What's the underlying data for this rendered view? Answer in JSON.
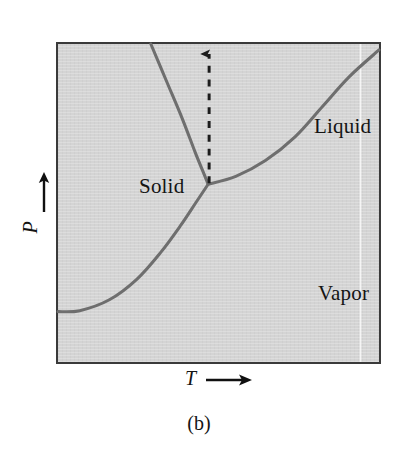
{
  "figure": {
    "caption": "(b)",
    "background_color": "#ffffff",
    "plot_fill_color": "#d4d4d4",
    "frame_color": "#3a3a3a",
    "curve_color": "#6e6e6e",
    "text_color": "#141414"
  },
  "axes": {
    "x": {
      "label": "T",
      "arrow_icon": "right-arrow-icon"
    },
    "y": {
      "label": "P",
      "arrow_icon": "up-arrow-icon"
    }
  },
  "regions": [
    {
      "key": "solid",
      "label": "Solid"
    },
    {
      "key": "liquid",
      "label": "Liquid"
    },
    {
      "key": "vapor",
      "label": "Vapor"
    }
  ],
  "annotations": {
    "process_path": {
      "name": "isothermal-heating-arrow",
      "style": "dashed",
      "arrow_icon": "up-arrow-icon"
    }
  },
  "chart_data": {
    "type": "line",
    "title": "",
    "subtitle": "",
    "xlabel": "T",
    "ylabel": "P",
    "xlim": [
      0,
      325
    ],
    "ylim": [
      0,
      322
    ],
    "grid": false,
    "legend": null,
    "axis_tick_labels": {
      "x": [],
      "y": []
    },
    "points_of_interest": [
      {
        "name": "triple-point",
        "x": 152,
        "y": 142
      }
    ],
    "series": [
      {
        "name": "fusion-curve",
        "description": "solid-liquid coexistence boundary, steep positive slope",
        "style": "solid",
        "points": [
          [
            94,
            0
          ],
          [
            110,
            38
          ],
          [
            126,
            76
          ],
          [
            139,
            110
          ],
          [
            148,
            132
          ],
          [
            152,
            142
          ]
        ]
      },
      {
        "name": "vaporization-curve",
        "description": "liquid-vapor coexistence boundary, rising concave-up to the right edge",
        "style": "solid",
        "points": [
          [
            152,
            142
          ],
          [
            180,
            134
          ],
          [
            210,
            118
          ],
          [
            240,
            94
          ],
          [
            268,
            63
          ],
          [
            295,
            33
          ],
          [
            325,
            6
          ]
        ]
      },
      {
        "name": "sublimation-curve",
        "description": "solid-vapor coexistence boundary, descending to the left edge",
        "style": "solid",
        "points": [
          [
            152,
            142
          ],
          [
            140,
            160
          ],
          [
            124,
            184
          ],
          [
            104,
            211
          ],
          [
            80,
            238
          ],
          [
            52,
            259
          ],
          [
            22,
            270
          ],
          [
            0,
            271
          ]
        ]
      },
      {
        "name": "heating-path",
        "description": "dashed vertical arrow rising from the triple point through the solid-liquid boundary into the liquid region",
        "style": "dashed",
        "points": [
          [
            153,
            142
          ],
          [
            153,
            0
          ]
        ]
      }
    ]
  }
}
